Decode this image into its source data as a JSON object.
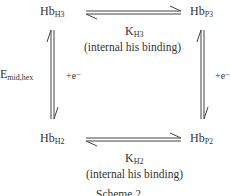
{
  "diagram": {
    "nodes": {
      "top_left": {
        "base": "Hb",
        "sub": "H3"
      },
      "top_right": {
        "base": "Hb",
        "sub": "P3"
      },
      "bottom_left": {
        "base": "Hb",
        "sub": "H2"
      },
      "bottom_right": {
        "base": "Hb",
        "sub": "P2"
      }
    },
    "edges": {
      "top": {
        "k_base": "K",
        "k_sub": "H3",
        "note": "(internal his binding)",
        "type": "equilibrium"
      },
      "bottom": {
        "k_base": "K",
        "k_sub": "H2",
        "note": "(internal his binding)",
        "type": "equilibrium"
      },
      "left": {
        "label_base": "E",
        "label_sub": "mid,hex",
        "electron": "+e⁻",
        "type": "equilibrium"
      },
      "right": {
        "electron": "+e⁻",
        "type": "equilibrium"
      }
    },
    "caption": "Scheme 2"
  }
}
